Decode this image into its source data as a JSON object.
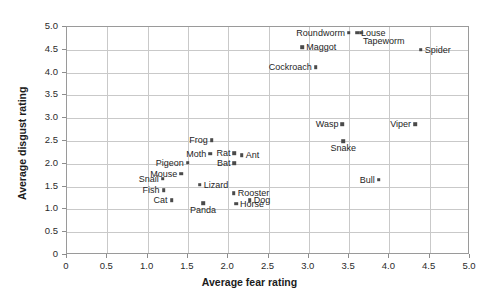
{
  "chart_data": {
    "type": "scatter",
    "title": "",
    "xlabel": "Average fear rating",
    "ylabel": "Average disgust rating",
    "xlim": [
      0,
      5.0
    ],
    "ylim": [
      0,
      5.0
    ],
    "grid": true,
    "legend": "none",
    "xticks": [
      "0",
      "0.5",
      "1.0",
      "1.5",
      "2.0",
      "2.5",
      "3.0",
      "3.5",
      "4.0",
      "4.5",
      "5.0"
    ],
    "xtick_values": [
      0,
      0.5,
      1.0,
      1.5,
      2.0,
      2.5,
      3.0,
      3.5,
      4.0,
      4.5,
      5.0
    ],
    "yticks": [
      "0",
      "0.5",
      "1.0",
      "1.5",
      "2.0",
      "2.5",
      "3.0",
      "3.5",
      "4.0",
      "4.5",
      "5.0"
    ],
    "ytick_values": [
      0,
      0.5,
      1.0,
      1.5,
      2.0,
      2.5,
      3.0,
      3.5,
      4.0,
      4.5,
      5.0
    ],
    "point_color": "#4a4a4a",
    "grid_color": "#c9c9c9",
    "frame_color": "#9a9a9a",
    "points": [
      {
        "label": "Roundworm",
        "x": 3.51,
        "y": 4.85,
        "label_pos": "left"
      },
      {
        "label": "Louse",
        "x": 3.61,
        "y": 4.85,
        "label_pos": "right"
      },
      {
        "label": "Tapeworm",
        "x": 3.66,
        "y": 4.85,
        "label_pos": "below-right"
      },
      {
        "label": "Maggot",
        "x": 2.93,
        "y": 4.53,
        "label_pos": "right"
      },
      {
        "label": "Spider",
        "x": 4.4,
        "y": 4.48,
        "label_pos": "right"
      },
      {
        "label": "Cockroach",
        "x": 3.1,
        "y": 4.1,
        "label_pos": "left"
      },
      {
        "label": "Wasp",
        "x": 3.43,
        "y": 2.85,
        "label_pos": "left"
      },
      {
        "label": "Viper",
        "x": 4.33,
        "y": 2.85,
        "label_pos": "left"
      },
      {
        "label": "Snake",
        "x": 3.44,
        "y": 2.47,
        "label_pos": "below"
      },
      {
        "label": "Frog",
        "x": 1.81,
        "y": 2.5,
        "label_pos": "left"
      },
      {
        "label": "Moth",
        "x": 1.79,
        "y": 2.2,
        "label_pos": "left"
      },
      {
        "label": "Rat",
        "x": 2.09,
        "y": 2.21,
        "label_pos": "left"
      },
      {
        "label": "Ant",
        "x": 2.18,
        "y": 2.17,
        "label_pos": "right"
      },
      {
        "label": "Pigeon",
        "x": 1.51,
        "y": 2.0,
        "label_pos": "left"
      },
      {
        "label": "Bat",
        "x": 2.09,
        "y": 1.99,
        "label_pos": "left"
      },
      {
        "label": "Mouse",
        "x": 1.43,
        "y": 1.76,
        "label_pos": "left"
      },
      {
        "label": "Bull",
        "x": 3.88,
        "y": 1.63,
        "label_pos": "left"
      },
      {
        "label": "Snail",
        "x": 1.2,
        "y": 1.65,
        "label_pos": "left"
      },
      {
        "label": "Lizard",
        "x": 1.66,
        "y": 1.52,
        "label_pos": "right"
      },
      {
        "label": "Fish",
        "x": 1.21,
        "y": 1.4,
        "label_pos": "left"
      },
      {
        "label": "Rooster",
        "x": 2.08,
        "y": 1.33,
        "label_pos": "right"
      },
      {
        "label": "Dog",
        "x": 2.28,
        "y": 1.18,
        "label_pos": "right"
      },
      {
        "label": "Cat",
        "x": 1.31,
        "y": 1.18,
        "label_pos": "left"
      },
      {
        "label": "Horse",
        "x": 2.11,
        "y": 1.1,
        "label_pos": "right"
      },
      {
        "label": "Panda",
        "x": 1.7,
        "y": 1.12,
        "label_pos": "below"
      }
    ]
  }
}
